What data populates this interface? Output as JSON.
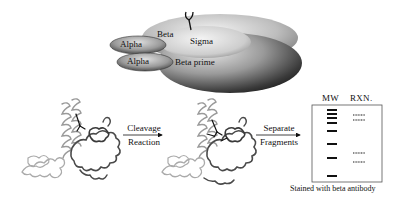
{
  "polymerase": {
    "subunits": [
      {
        "name": "Alpha"
      },
      {
        "name": "Alpha"
      },
      {
        "name": "Beta"
      },
      {
        "name": "Beta prime"
      },
      {
        "name": "Sigma"
      }
    ],
    "antibody_icon": "antibody-y-icon"
  },
  "steps": [
    {
      "top": "Cleavage",
      "bottom": "Reaction",
      "icon": "arrow-right-icon"
    },
    {
      "top": "Separate",
      "bottom": "Fragments",
      "icon": "arrow-right-icon"
    }
  ],
  "structures": [
    {
      "name": "protein-structure-intact",
      "antibody_icon": "antibody-y-icon"
    },
    {
      "name": "protein-structure-cleaved",
      "antibody_icon": "antibody-y-icon",
      "cut_icon": "scissor-cut-icon"
    }
  ],
  "gel": {
    "lanes": [
      "MW",
      "RXN."
    ],
    "mw_bands_y": [
      112,
      117,
      122,
      130,
      141,
      152,
      165,
      180
    ],
    "rxn_bands_y": [
      114,
      119,
      155,
      162
    ],
    "caption": "Stained with beta antibody"
  },
  "colors": {
    "ink": "#111111",
    "beta_light": "#d0d0d0",
    "beta_prime_dark": "#2a2a2a",
    "sigma": "#cfcfcf",
    "alpha": "#8a8a8a"
  }
}
